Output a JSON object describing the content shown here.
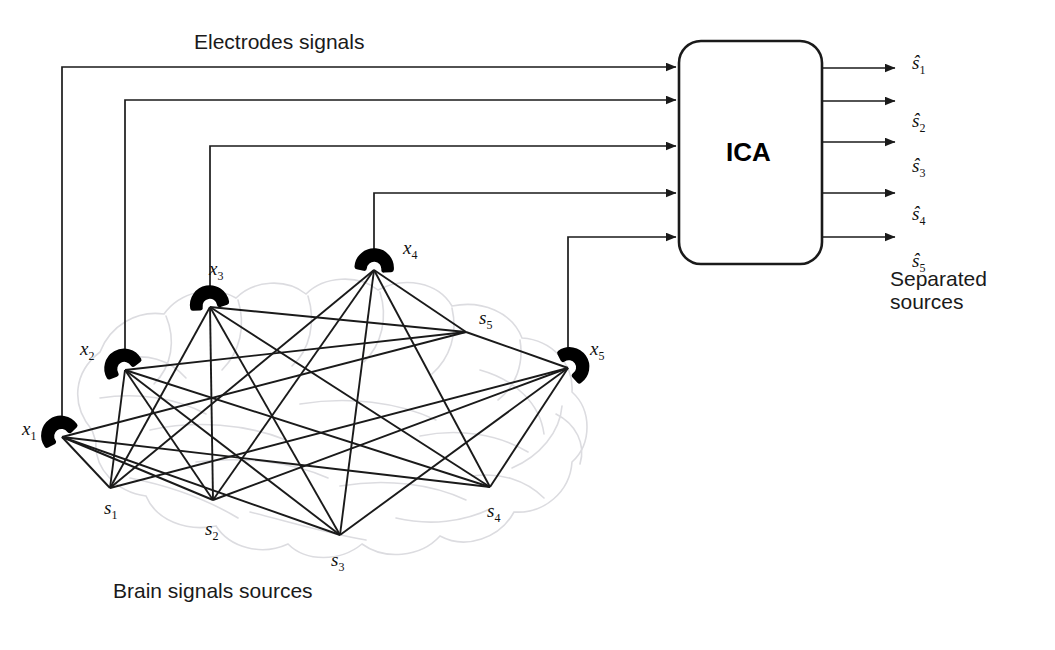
{
  "diagram": {
    "title_top": "Electrodes signals",
    "title_bottom": "Brain signals sources",
    "processor_label": "ICA",
    "output_caption_line1": "Separated",
    "output_caption_line2": "sources"
  },
  "electrodes": [
    {
      "id": "x1",
      "label": "x",
      "sub": "1",
      "x": 62,
      "y": 437,
      "label_x": 22,
      "label_y": 418,
      "bus_y": 67,
      "rot": -35
    },
    {
      "id": "x2",
      "label": "x",
      "sub": "2",
      "x": 125,
      "y": 370,
      "label_x": 80,
      "label_y": 338,
      "bus_y": 100,
      "rot": -30
    },
    {
      "id": "x3",
      "label": "x",
      "sub": "3",
      "x": 210,
      "y": 307,
      "label_x": 209,
      "label_y": 258,
      "bus_y": 146,
      "rot": -10
    },
    {
      "id": "x4",
      "label": "x",
      "sub": "4",
      "x": 374,
      "y": 270,
      "label_x": 403,
      "label_y": 237,
      "bus_y": 193,
      "rot": 5
    },
    {
      "id": "x5",
      "label": "x",
      "sub": "5",
      "x": 568,
      "y": 368,
      "label_x": 590,
      "label_y": 338,
      "bus_y": 237,
      "rot": 55
    }
  ],
  "sources": [
    {
      "id": "s1",
      "label": "s",
      "sub": "1",
      "x": 110,
      "y": 488,
      "label_x": 104,
      "label_y": 497
    },
    {
      "id": "s2",
      "label": "s",
      "sub": "2",
      "x": 213,
      "y": 500,
      "label_x": 205,
      "label_y": 518
    },
    {
      "id": "s3",
      "label": "s",
      "sub": "3",
      "x": 340,
      "y": 535,
      "label_x": 331,
      "label_y": 549
    },
    {
      "id": "s4",
      "label": "s",
      "sub": "4",
      "x": 490,
      "y": 487,
      "label_x": 487,
      "label_y": 500
    },
    {
      "id": "s5",
      "label": "s",
      "sub": "5",
      "x": 466,
      "y": 332,
      "label_x": 479,
      "label_y": 307
    }
  ],
  "processor": {
    "x": 679,
    "y": 41,
    "w": 143,
    "h": 223,
    "radius": 22,
    "input_ys": [
      67,
      100,
      146,
      193,
      237
    ],
    "output_ys": [
      68,
      101,
      142,
      193,
      237
    ]
  },
  "outputs": [
    {
      "id": "s_hat_1",
      "label": "s",
      "sub": "1",
      "label_x": 912,
      "label_y": 52
    },
    {
      "id": "s_hat_2",
      "label": "s",
      "sub": "2",
      "label_x": 912,
      "label_y": 110
    },
    {
      "id": "s_hat_3",
      "label": "s",
      "sub": "3",
      "label_x": 912,
      "label_y": 155
    },
    {
      "id": "s_hat_4",
      "label": "s",
      "sub": "4",
      "label_x": 912,
      "label_y": 203
    },
    {
      "id": "s_hat_5",
      "label": "s",
      "sub": "5",
      "label_x": 912,
      "label_y": 250
    }
  ],
  "text_positions": {
    "title_top_x": 194,
    "title_top_y": 30,
    "title_bottom_x": 113,
    "title_bottom_y": 579,
    "ica_x": 726,
    "ica_y": 137,
    "caption_x": 890,
    "caption_y": 268
  },
  "colors": {
    "line": "#1a1a1a",
    "brain": "#d9d9dd",
    "electrode": "#000000",
    "text": "#1a1a1a",
    "background": "#ffffff"
  }
}
